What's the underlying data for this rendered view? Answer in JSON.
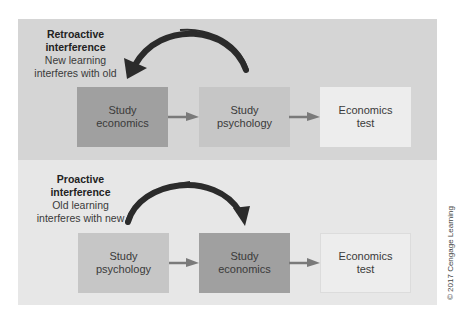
{
  "diagram": {
    "panels": [
      {
        "id": "retroactive",
        "title_line1": "Retroactive",
        "title_line2": "interference",
        "desc_line1": "New learning",
        "desc_line2": "interferes with old",
        "boxes": [
          {
            "line1": "Study",
            "line2": "economics",
            "shade": "dark"
          },
          {
            "line1": "Study",
            "line2": "psychology",
            "shade": "mid"
          },
          {
            "line1": "Economics",
            "line2": "test",
            "shade": "light"
          }
        ],
        "curved_arrow": {
          "from": "Study psychology",
          "to": "Study economics"
        }
      },
      {
        "id": "proactive",
        "title_line1": "Proactive",
        "title_line2": "interference",
        "desc_line1": "Old learning",
        "desc_line2": "interferes with new",
        "boxes": [
          {
            "line1": "Study",
            "line2": "psychology",
            "shade": "mid"
          },
          {
            "line1": "Study",
            "line2": "economics",
            "shade": "dark"
          },
          {
            "line1": "Economics",
            "line2": "test",
            "shade": "light"
          }
        ],
        "curved_arrow": {
          "from": "Study psychology",
          "to": "Study economics"
        }
      }
    ],
    "copyright": "© 2017 Cengage Learning",
    "colors": {
      "panel_top": "#d5d5d5",
      "panel_bottom": "#e7e7e7",
      "box_dark": "#a0a0a0",
      "box_mid": "#c6c6c6",
      "box_light": "#ededed",
      "arrow": "#2b2b2b",
      "connector": "#7a7a7a"
    }
  }
}
